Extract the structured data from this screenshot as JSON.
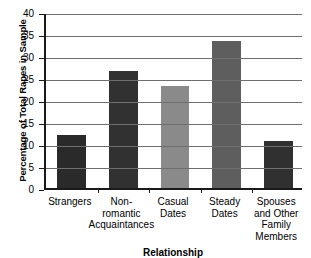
{
  "chart_data": {
    "type": "bar",
    "title": "",
    "xlabel": "Relationship",
    "ylabel": "Percentage of Total Rapes in Sample",
    "categories": [
      "Strangers",
      "Non-romantic Acquaintances",
      "Casual Dates",
      "Steady Dates",
      "Spouses and Other Family Members"
    ],
    "category_lines": [
      [
        "Strangers"
      ],
      [
        "Non-",
        "romantic",
        "Acquaintances"
      ],
      [
        "Casual",
        "Dates"
      ],
      [
        "Steady",
        "Dates"
      ],
      [
        "Spouses",
        "and Other",
        "Family",
        "Members"
      ]
    ],
    "values": [
      12.0,
      26.6,
      23.2,
      33.4,
      10.7
    ],
    "bar_colors": [
      "#2a2a2a",
      "#313131",
      "#8a8a8a",
      "#5e5e5e",
      "#303030"
    ],
    "ylim": [
      0,
      40
    ],
    "ytick_values": [
      0,
      5,
      10,
      15,
      20,
      25,
      30,
      35,
      40
    ],
    "ytick_labels": [
      "0",
      "5",
      "10",
      "15",
      "20",
      "25",
      "30",
      "35",
      "40"
    ],
    "grid": true,
    "legend": "none",
    "axis_color": "#1a1a1a",
    "grid_color": "#6f6f6f",
    "background": "#ffffff"
  }
}
